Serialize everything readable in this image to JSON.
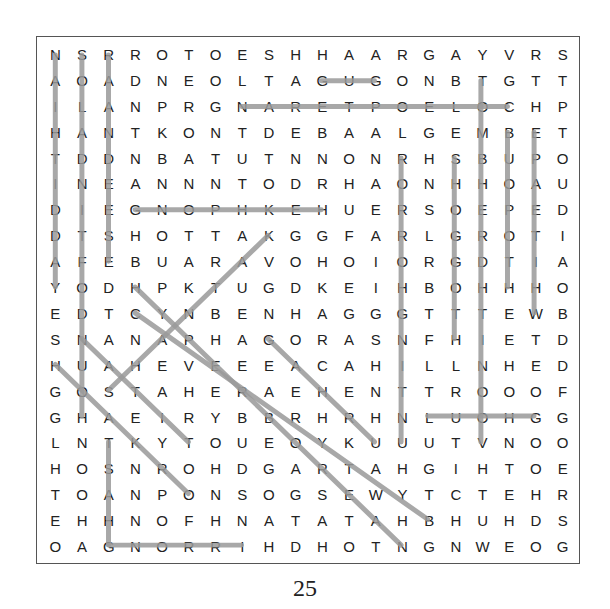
{
  "puzzle": {
    "rows": 20,
    "cols": 20,
    "grid": [
      "NSRROTOESHHAARGAYVRS",
      "AOADNEOLTAGUGONBTGTT",
      "ILANPRGNARETPOELOCHP",
      "HANTKONTDEBAALGEMBET",
      "TDDNBATUTNNONRHSBUPO",
      "INEANNNTODRHAONHHOAU",
      "DIEGNOPHKEHUERSOEPED",
      "DTSHOTTAKGGFARLGROTI",
      "AFEBUARAVOHOIORGDTIA",
      "YODHPKTUGDKEIHBOHHHO",
      "EDTCYNBENHAGGGTTTEWB",
      "SNANAPHAGORASNFHIETD",
      "HUAHEVEEEACAHILLNHED",
      "GOSTAHERAEHENTTROOOF",
      "GHAEIRYBBRHRHNLUOHGG",
      "LNTKYTOUEOYKUUUTVNOO",
      "HOSNROHDGARTAHGIHTOE",
      "TOANPONSOGSEWYTCTEHR",
      "EHHNOFHNATATAHBHUHDS",
      "OAGNORRIHDHOTNGNWEOG"
    ],
    "found_lines": [
      {
        "from": [
          0,
          0
        ],
        "to": [
          9,
          0
        ]
      },
      {
        "from": [
          0,
          1
        ],
        "to": [
          14,
          1
        ]
      },
      {
        "from": [
          0,
          2
        ],
        "to": [
          8,
          2
        ]
      },
      {
        "from": [
          1,
          10
        ],
        "to": [
          1,
          12
        ]
      },
      {
        "from": [
          2,
          7
        ],
        "to": [
          2,
          17
        ]
      },
      {
        "from": [
          6,
          3
        ],
        "to": [
          6,
          10
        ]
      },
      {
        "from": [
          4,
          13
        ],
        "to": [
          15,
          13
        ]
      },
      {
        "from": [
          4,
          15
        ],
        "to": [
          11,
          15
        ]
      },
      {
        "from": [
          1,
          16
        ],
        "to": [
          15,
          16
        ]
      },
      {
        "from": [
          3,
          17
        ],
        "to": [
          9,
          17
        ]
      },
      {
        "from": [
          3,
          18
        ],
        "to": [
          10,
          18
        ]
      },
      {
        "from": [
          14,
          14
        ],
        "to": [
          14,
          18
        ]
      },
      {
        "from": [
          15,
          2
        ],
        "to": [
          19,
          2
        ]
      },
      {
        "from": [
          19,
          2
        ],
        "to": [
          19,
          7
        ]
      },
      {
        "from": [
          13,
          2
        ],
        "to": [
          7,
          8
        ]
      },
      {
        "from": [
          9,
          3
        ],
        "to": [
          19,
          13
        ]
      },
      {
        "from": [
          10,
          3
        ],
        "to": [
          18,
          14
        ]
      },
      {
        "from": [
          11,
          1
        ],
        "to": [
          15,
          5
        ]
      },
      {
        "from": [
          11,
          8
        ],
        "to": [
          15,
          12
        ]
      },
      {
        "from": [
          12,
          0
        ],
        "to": [
          17,
          5
        ]
      }
    ],
    "line_color": "#9a9a9a"
  },
  "page": {
    "number": "25"
  }
}
